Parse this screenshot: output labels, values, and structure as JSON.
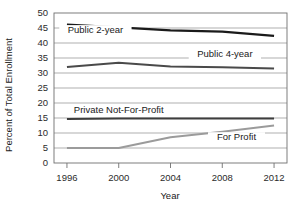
{
  "chart_data": {
    "type": "line",
    "title": "",
    "xlabel": "Year",
    "ylabel": "Percent of Total Enrollment",
    "xlim": [
      1995,
      2013
    ],
    "ylim": [
      0,
      50
    ],
    "grid": true,
    "legend_position": "inline-labels",
    "x_ticks": [
      "1996",
      "2000",
      "2004",
      "2008",
      "2012"
    ],
    "x_tick_values": [
      1996,
      2000,
      2004,
      2008,
      2012
    ],
    "y_ticks": [
      "0",
      "5",
      "10",
      "15",
      "20",
      "25",
      "30",
      "35",
      "40",
      "45",
      "50"
    ],
    "y_tick_values": [
      0,
      5,
      10,
      15,
      20,
      25,
      30,
      35,
      40,
      45,
      50
    ],
    "x": [
      1996,
      2000,
      2004,
      2008,
      2012
    ],
    "series": [
      {
        "name": "Public 2-year",
        "color": "#1a1a1a",
        "width": 2.2,
        "values": [
          46.1,
          45.2,
          44.2,
          43.8,
          42.4
        ]
      },
      {
        "name": "Public 4-year",
        "color": "#4a4a4a",
        "width": 2.0,
        "values": [
          32.0,
          33.4,
          32.2,
          31.9,
          31.5
        ]
      },
      {
        "name": "Private Not-For-Profit",
        "color": "#3d3d3d",
        "width": 2.0,
        "values": [
          14.7,
          14.8,
          14.8,
          14.8,
          14.8
        ]
      },
      {
        "name": "For Profit",
        "color": "#9b9b9b",
        "width": 2.0,
        "values": [
          5.0,
          5.0,
          8.6,
          10.4,
          12.5
        ]
      }
    ],
    "annotations": [
      {
        "text": "Public 2-year",
        "x": 1998.2,
        "y": 43.3
      },
      {
        "text": "Public 4-year",
        "x": 2008.2,
        "y": 35.3
      },
      {
        "text": "Private Not-For-Profit",
        "x": 2000.0,
        "y": 16.6
      },
      {
        "text": "For Profit",
        "x": 2009.1,
        "y": 7.6
      }
    ]
  }
}
